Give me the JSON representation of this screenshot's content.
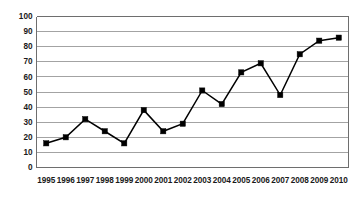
{
  "chart_data": {
    "type": "line",
    "title": "",
    "subtitle": "",
    "xlabel": "",
    "ylabel": "",
    "categories": [
      "1995",
      "1996",
      "1997",
      "1998",
      "1999",
      "2000",
      "2001",
      "2002",
      "2003",
      "2004",
      "2005",
      "2006",
      "2007",
      "2008",
      "2009",
      "2010"
    ],
    "values": [
      16,
      20,
      32,
      24,
      16,
      38,
      24,
      29,
      51,
      42,
      63,
      69,
      48,
      75,
      84,
      86
    ],
    "series": [
      {
        "name": "",
        "values": [
          16,
          20,
          32,
          24,
          16,
          38,
          24,
          29,
          51,
          42,
          63,
          69,
          48,
          75,
          84,
          86
        ]
      }
    ],
    "ylim": [
      0,
      100
    ],
    "yticks": [
      0,
      10,
      20,
      30,
      40,
      50,
      60,
      70,
      80,
      90,
      100
    ],
    "ytick_labels": [
      "0",
      "10",
      "20",
      "30",
      "40",
      "50",
      "60",
      "70",
      "80",
      "90",
      "100"
    ],
    "xtick_labels": [
      "1995",
      "1996",
      "1997",
      "1998",
      "1999",
      "2000",
      "2001",
      "2002",
      "2003",
      "2004",
      "2005",
      "2006",
      "2007",
      "2008",
      "2009",
      "2010"
    ],
    "grid": "horizontal",
    "legend": "none",
    "marker": "square",
    "line_color": "#000000",
    "marker_color": "#000000",
    "grid_color": "#8c8c8c",
    "axis_color": "#6e6e6e",
    "background_color": "#ffffff",
    "annotations": []
  }
}
